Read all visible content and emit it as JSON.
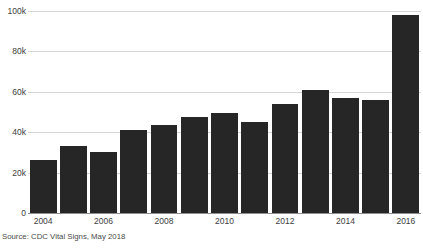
{
  "chart_data": {
    "type": "bar",
    "title": "",
    "subtitle": "",
    "xlabel": "",
    "ylabel": "",
    "categories": [
      "2004",
      "2005",
      "2006",
      "2007",
      "2008",
      "2009",
      "2010",
      "2011",
      "2012",
      "2013",
      "2014",
      "2015",
      "2016"
    ],
    "values": [
      26000,
      33000,
      30000,
      41000,
      43500,
      47500,
      49500,
      45000,
      54000,
      61000,
      57000,
      56000,
      98000
    ],
    "ylim": [
      0,
      100000
    ],
    "yticks": [
      0,
      20000,
      40000,
      60000,
      80000,
      100000
    ],
    "ytick_labels": [
      "0",
      "20k",
      "40k",
      "60k",
      "80k",
      "100k"
    ],
    "xtick_labels": [
      "2004",
      "2006",
      "2008",
      "2010",
      "2012",
      "2014",
      "2016"
    ],
    "grid": true,
    "legend": false,
    "legend_position": "none",
    "bar_color": "#262626",
    "grid_color": "#d6d6d6",
    "axis_color": "#8d8d8d",
    "annotations": []
  },
  "source": {
    "text": "Source: CDC Vital Signs, May 2018"
  }
}
